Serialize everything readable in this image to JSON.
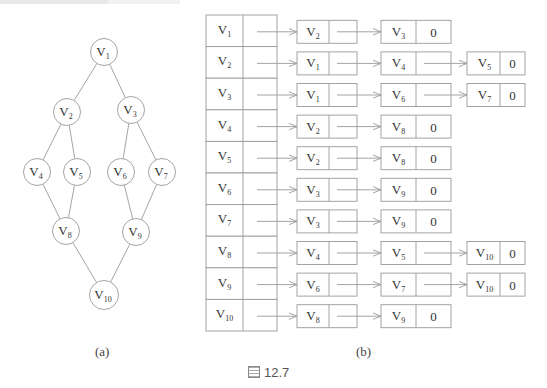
{
  "figure": {
    "number_label": "圖 12.7",
    "panel_a_caption": "(a)",
    "panel_b_caption": "(b)"
  },
  "colors": {
    "stroke": "#9a9a9a",
    "text": "#333333"
  },
  "graph": {
    "nodes": [
      {
        "id": "V1",
        "label": "V",
        "sub": "1",
        "x": 104,
        "y": 52
      },
      {
        "id": "V2",
        "label": "V",
        "sub": "2",
        "x": 67,
        "y": 112
      },
      {
        "id": "V3",
        "label": "V",
        "sub": "3",
        "x": 131,
        "y": 110
      },
      {
        "id": "V4",
        "label": "V",
        "sub": "4",
        "x": 37,
        "y": 172
      },
      {
        "id": "V5",
        "label": "V",
        "sub": "5",
        "x": 77,
        "y": 172
      },
      {
        "id": "V6",
        "label": "V",
        "sub": "6",
        "x": 121,
        "y": 172
      },
      {
        "id": "V7",
        "label": "V",
        "sub": "7",
        "x": 162,
        "y": 172
      },
      {
        "id": "V8",
        "label": "V",
        "sub": "8",
        "x": 66,
        "y": 231
      },
      {
        "id": "V9",
        "label": "V",
        "sub": "9",
        "x": 136,
        "y": 232
      },
      {
        "id": "V10",
        "label": "V",
        "sub": "10",
        "x": 104,
        "y": 295
      }
    ],
    "edges": [
      [
        "V1",
        "V2"
      ],
      [
        "V1",
        "V3"
      ],
      [
        "V2",
        "V4"
      ],
      [
        "V2",
        "V5"
      ],
      [
        "V3",
        "V6"
      ],
      [
        "V3",
        "V7"
      ],
      [
        "V4",
        "V8"
      ],
      [
        "V5",
        "V8"
      ],
      [
        "V6",
        "V9"
      ],
      [
        "V7",
        "V9"
      ],
      [
        "V8",
        "V10"
      ],
      [
        "V9",
        "V10"
      ]
    ]
  },
  "adjacency_list": {
    "heads": [
      {
        "label": "V",
        "sub": "1",
        "list": [
          {
            "sub": "2"
          },
          {
            "sub": "3"
          }
        ]
      },
      {
        "label": "V",
        "sub": "2",
        "list": [
          {
            "sub": "1"
          },
          {
            "sub": "4"
          },
          {
            "sub": "5"
          }
        ]
      },
      {
        "label": "V",
        "sub": "3",
        "list": [
          {
            "sub": "1"
          },
          {
            "sub": "6"
          },
          {
            "sub": "7"
          }
        ]
      },
      {
        "label": "V",
        "sub": "4",
        "list": [
          {
            "sub": "2"
          },
          {
            "sub": "8"
          }
        ]
      },
      {
        "label": "V",
        "sub": "5",
        "list": [
          {
            "sub": "2"
          },
          {
            "sub": "8"
          }
        ]
      },
      {
        "label": "V",
        "sub": "6",
        "list": [
          {
            "sub": "3"
          },
          {
            "sub": "9"
          }
        ]
      },
      {
        "label": "V",
        "sub": "7",
        "list": [
          {
            "sub": "3"
          },
          {
            "sub": "9"
          }
        ]
      },
      {
        "label": "V",
        "sub": "8",
        "list": [
          {
            "sub": "4"
          },
          {
            "sub": "5"
          },
          {
            "sub": "10"
          }
        ]
      },
      {
        "label": "V",
        "sub": "9",
        "list": [
          {
            "sub": "6"
          },
          {
            "sub": "7"
          },
          {
            "sub": "10"
          }
        ]
      },
      {
        "label": "V",
        "sub": "10",
        "list": [
          {
            "sub": "8"
          },
          {
            "sub": "9"
          }
        ]
      }
    ],
    "null_marker": "0"
  }
}
